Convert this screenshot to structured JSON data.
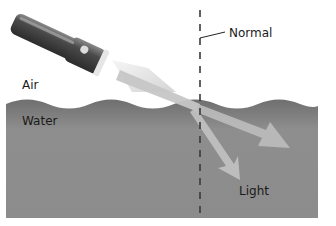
{
  "diagram": {
    "labels": {
      "air": "Air",
      "water": "Water",
      "normal": "Normal",
      "light": "Light"
    },
    "elements": {
      "light_source": "flashlight",
      "boundary": "wavy water surface",
      "normal_line": "dashed vertical line",
      "incident_ray": "beam from flashlight to surface",
      "reflected_ray": "arrow continuing shallower to the right",
      "refracted_ray": "arrow bending toward the normal into water"
    },
    "colors": {
      "water": "#8a8a8a",
      "water_dark": "#6e6e6e",
      "beam": "#c4c4c4",
      "flashlight_body": "#4a4a4a",
      "normal_line": "#3a3a3a",
      "background": "#ffffff"
    }
  }
}
